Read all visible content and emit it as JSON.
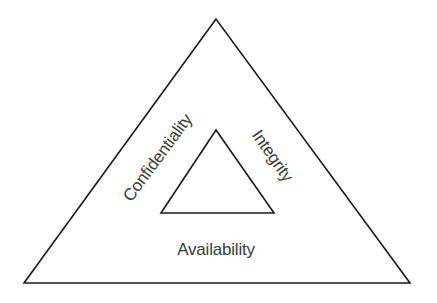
{
  "diagram": {
    "colors": {
      "line": "#1a1a1a",
      "text": "#3a3a3a",
      "background": "#ffffff"
    },
    "outer_triangle": {
      "points": [
        [
          216,
          19
        ],
        [
          24,
          283
        ],
        [
          410,
          283
        ]
      ]
    },
    "inner_triangle": {
      "points": [
        [
          216,
          130
        ],
        [
          161,
          213
        ],
        [
          274,
          213
        ]
      ]
    },
    "labels": {
      "left": "Confidentiality",
      "right": "Integrity",
      "bottom": "Availability"
    }
  }
}
